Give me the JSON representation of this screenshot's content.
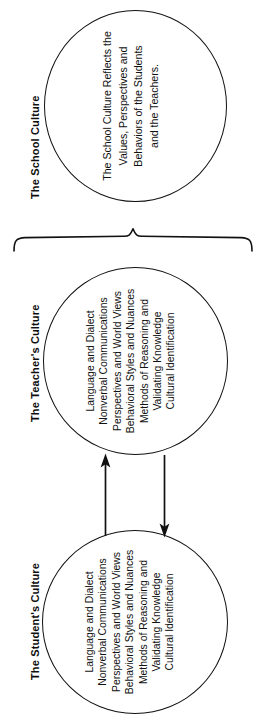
{
  "figure": {
    "background_color": "#ffffff",
    "line_color": "#111111"
  },
  "sections": {
    "school": {
      "label": "The School Culture",
      "circle_text_lines": [
        "The School Culture Reflects the",
        "Values, Perspectives and",
        "Behaviors of the Students",
        "and the Teachers."
      ]
    },
    "teacher": {
      "label": "The Teacher's Culture",
      "circle_text_lines": [
        "Language and Dialect",
        "Nonverbal Communications",
        "Perspectives and World Views",
        "Behavioral Styles and Nuances",
        "Methods of Reasoning and",
        "Validating Knowledge",
        "Cultural Identification"
      ]
    },
    "student": {
      "label": "The Student's Culture",
      "circle_text_lines": [
        "Language and Dialect",
        "Nonverbal Communications",
        "Perspectives and World Views",
        "Behavioral Styles and Nuances",
        "Methods of Reasoning and",
        "Validating Knowledge",
        "Cultural Identification"
      ]
    }
  },
  "connectors": {
    "brace": {
      "name": "horizontal-curly-brace",
      "orientation": "points-up",
      "groups": [
        "The Teacher's Culture",
        "The Student's Culture"
      ],
      "points_to": "The School Culture"
    },
    "arrow_up": {
      "name": "student-to-teacher-arrow",
      "direction": "up",
      "from": "The Student's Culture",
      "to": "The Teacher's Culture"
    },
    "arrow_down": {
      "name": "teacher-to-student-arrow",
      "direction": "down",
      "from": "The Teacher's Culture",
      "to": "The Student's Culture"
    }
  }
}
